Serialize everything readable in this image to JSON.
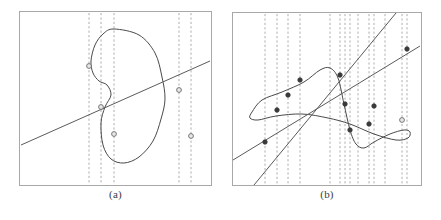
{
  "figure": {
    "title": "",
    "background_color": "#ffffff",
    "panels": [
      {
        "id": "a",
        "caption": "(a)"
      },
      {
        "id": "b",
        "caption": "(b)"
      }
    ]
  },
  "style": {
    "frame_color": "#a8a8a8",
    "curve_color": "#4a4a4a",
    "line_color": "#5a5a5a",
    "dashed_color": "#9a9a9a",
    "marker_fill_open": "#e8e8e8",
    "marker_fill_solid": "#3a3a3a",
    "marker_stroke": "#6a6a6a"
  },
  "chart_data": [
    {
      "type": "line",
      "panel": "a",
      "title": "(a)",
      "xlabel": "",
      "ylabel": "",
      "xlim": [
        0,
        193
      ],
      "ylim": [
        0,
        175
      ],
      "grid": false,
      "legend": null,
      "description": "A closed self-intersecting loop curve crossed by a gently rising straight line; five open circle markers mark intersections; five vertical dashed lines pass through the marker abscissae.",
      "series": [
        {
          "name": "closed-loop-curve",
          "kind": "closed-curve",
          "points": [
            [
              95,
              18
            ],
            [
              120,
              24
            ],
            [
              136,
              42
            ],
            [
              143,
              66
            ],
            [
              146,
              88
            ],
            [
              142,
              108
            ],
            [
              134,
              130
            ],
            [
              120,
              146
            ],
            [
              105,
              152
            ],
            [
              92,
              148
            ],
            [
              84,
              134
            ],
            [
              82,
              112
            ],
            [
              86,
              96
            ],
            [
              92,
              84
            ],
            [
              88,
              74
            ],
            [
              80,
              70
            ],
            [
              74,
              62
            ],
            [
              72,
              50
            ],
            [
              76,
              34
            ],
            [
              84,
              23
            ],
            [
              95,
              18
            ]
          ]
        },
        {
          "name": "straight-line",
          "kind": "line",
          "points": [
            [
              2,
              134
            ],
            [
              191,
              50
            ]
          ]
        }
      ],
      "markers": [
        {
          "x": 70,
          "y": 55,
          "style": "open"
        },
        {
          "x": 82,
          "y": 96,
          "style": "open"
        },
        {
          "x": 95,
          "y": 123,
          "style": "open"
        },
        {
          "x": 160,
          "y": 79,
          "style": "open"
        },
        {
          "x": 172,
          "y": 125,
          "style": "open"
        }
      ],
      "dashed_verticals": [
        70,
        82,
        95,
        160,
        172
      ],
      "dashed_vertical_count": 5
    },
    {
      "type": "line",
      "panel": "b",
      "title": "(b)",
      "xlabel": "",
      "ylabel": "",
      "xlim": [
        0,
        190
      ],
      "ylim": [
        0,
        174
      ],
      "grid": false,
      "legend": null,
      "description": "A horizontally-elongated self-intersecting loop curve crossed by two straight lines (one shallow rising, one steep rising); eleven solid dot markers mark the intersection points; eleven vertical dashed lines pass through the marker abscissae.",
      "series": [
        {
          "name": "elongated-loop-curve",
          "kind": "closed-curve",
          "points": [
            [
              20,
              100
            ],
            [
              30,
              88
            ],
            [
              50,
              80
            ],
            [
              72,
              70
            ],
            [
              88,
              58
            ],
            [
              98,
              56
            ],
            [
              106,
              66
            ],
            [
              112,
              92
            ],
            [
              118,
              118
            ],
            [
              124,
              132
            ],
            [
              132,
              136
            ],
            [
              142,
              130
            ],
            [
              158,
              122
            ],
            [
              172,
              118
            ],
            [
              178,
              120
            ],
            [
              176,
              126
            ],
            [
              164,
              128
            ],
            [
              142,
              122
            ],
            [
              118,
              112
            ],
            [
              96,
              106
            ],
            [
              70,
              102
            ],
            [
              44,
              104
            ],
            [
              26,
              108
            ],
            [
              18,
              106
            ],
            [
              20,
              100
            ]
          ]
        },
        {
          "name": "shallow-rising-line",
          "kind": "line",
          "points": [
            [
              1,
              148
            ],
            [
              188,
              34
            ]
          ]
        },
        {
          "name": "steep-rising-line",
          "kind": "line",
          "points": [
            [
              22,
              173
            ],
            [
              164,
              1
            ]
          ]
        }
      ],
      "markers": [
        {
          "x": 33,
          "y": 130,
          "style": "solid"
        },
        {
          "x": 45,
          "y": 98,
          "style": "solid"
        },
        {
          "x": 56,
          "y": 83,
          "style": "solid"
        },
        {
          "x": 68,
          "y": 68,
          "style": "solid"
        },
        {
          "x": 108,
          "y": 63,
          "style": "solid"
        },
        {
          "x": 113,
          "y": 92,
          "style": "solid"
        },
        {
          "x": 118,
          "y": 118,
          "style": "solid"
        },
        {
          "x": 137,
          "y": 112,
          "style": "solid"
        },
        {
          "x": 142,
          "y": 94,
          "style": "solid"
        },
        {
          "x": 170,
          "y": 108,
          "style": "open"
        },
        {
          "x": 175,
          "y": 37,
          "style": "solid"
        }
      ],
      "dashed_verticals": [
        33,
        45,
        56,
        68,
        98,
        108,
        113,
        118,
        126,
        137,
        142,
        153,
        170,
        175
      ],
      "dashed_vertical_count": 14
    }
  ]
}
